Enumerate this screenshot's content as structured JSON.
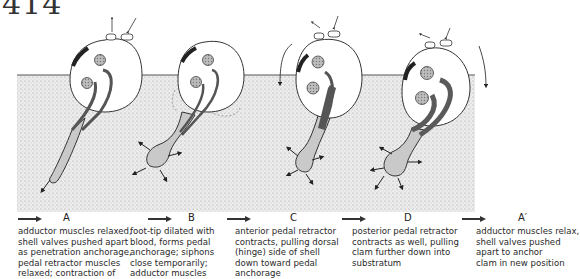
{
  "page_number": "414",
  "figure": {
    "colors": {
      "sediment": "#e4e4e4",
      "foot": "#c9c9c9",
      "muscle": "#5a5a5a",
      "outline": "#333333"
    },
    "stages": [
      {
        "letter": "A",
        "description": "adductor muscles relaxed,\nshell valves pushed apart\nas penetration anchorage,\npedal retractor muscles\nrelaxed; contraction of"
      },
      {
        "letter": "B",
        "description": "foot-tip dilated with\nblood, forms pedal\nanchorage; siphons\nclose temporarily;\nadductor muscles"
      },
      {
        "letter": "C",
        "description": "anterior pedal retractor\ncontracts, pulling dorsal\n(hinge) side of shell\ndown toward pedal\nanchorage"
      },
      {
        "letter": "D",
        "description": "posterior pedal retractor\ncontracts as well, pulling\nclam further down into\nsubstratum"
      },
      {
        "letter": "A′",
        "description": "adductor muscles relax,\nshell valves pushed\napart to anchor\nclam in new position"
      }
    ]
  }
}
